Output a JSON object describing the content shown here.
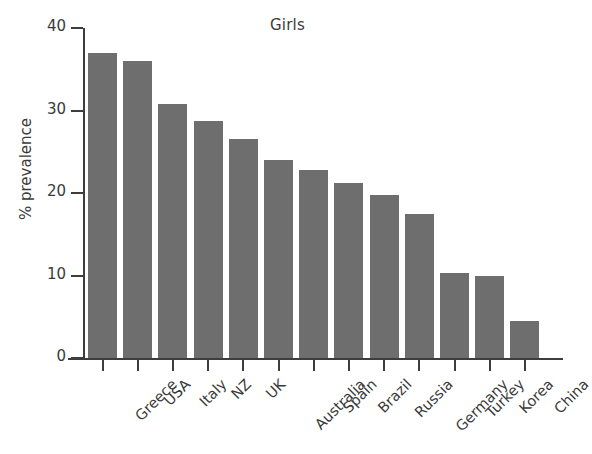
{
  "chart_data": {
    "type": "bar",
    "title": "Girls",
    "xlabel": "",
    "ylabel": "% prevalence",
    "categories": [
      "Greece",
      "USA",
      "Italy",
      "NZ",
      "UK",
      "Australia",
      "Spain",
      "Brazil",
      "Russia",
      "Germany",
      "Turkey",
      "Korea",
      "China"
    ],
    "values": [
      37.0,
      36.0,
      30.8,
      28.7,
      26.5,
      24.0,
      22.8,
      21.2,
      19.8,
      17.5,
      10.3,
      10.0,
      4.5
    ],
    "ylim": [
      0,
      40
    ],
    "yticks": [
      0,
      10,
      20,
      30,
      40
    ],
    "ytick_labels": [
      "0",
      "10",
      "20",
      "30",
      "40"
    ],
    "grid": false,
    "legend": false,
    "bar_color": "#6e6e6e",
    "axis_color": "#3d3d3d",
    "background": "#ffffff",
    "xtick_label_rotation": -45
  }
}
